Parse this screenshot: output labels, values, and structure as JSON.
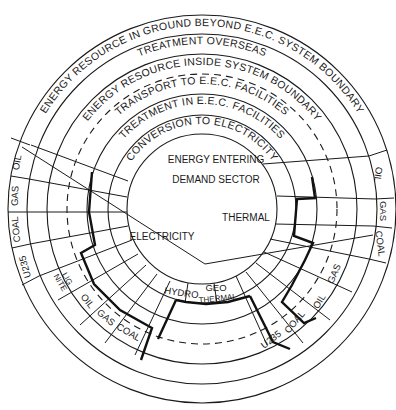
{
  "diagram": {
    "rings": [
      {
        "id": "ring-ground",
        "label": "ENERGY RESOURCE IN GROUND BEYOND E.E.C. SYSTEM BOUNDARY"
      },
      {
        "id": "ring-overseas",
        "label": "TREATMENT OVERSEAS"
      },
      {
        "id": "ring-inside",
        "label": "ENERGY RESOURCE INSIDE SYSTEM BOUNDARY"
      },
      {
        "id": "ring-transport",
        "label": "TRANSPORT TO E.E.C. FACILITIES"
      },
      {
        "id": "ring-treatment",
        "label": "TREATMENT IN E.E.C. FACILITIES"
      },
      {
        "id": "ring-conversion",
        "label": "CONVERSION TO ELECTRICITY"
      }
    ],
    "center": {
      "title_line1": "ENERGY ENTERING",
      "title_line2": "DEMAND SECTOR",
      "sectors": [
        {
          "id": "electricity",
          "label": "ELECTRICITY"
        },
        {
          "id": "thermal",
          "label": "THERMAL"
        }
      ]
    },
    "left_fuels": [
      "OIL",
      "GAS",
      "COAL",
      "U235"
    ],
    "right_fuels": [
      "OIL",
      "GAS",
      "COAL"
    ],
    "lower_left_fuels": {
      "lignite_1": "LIG",
      "lignite_2": "NITE",
      "oil": "OIL",
      "gas": "GAS",
      "coal": "COAL"
    },
    "lower_center": {
      "hydro": "HYDRO",
      "geo_1": "GEO",
      "geo_2": "THERMAL"
    },
    "lower_right_fuels": {
      "u235": "U235",
      "coal": "COAL",
      "oil": "OIL",
      "gas": "GAS"
    }
  }
}
